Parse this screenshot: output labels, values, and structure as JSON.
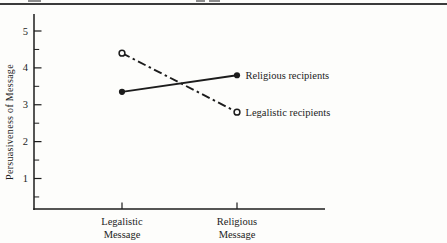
{
  "figure": {
    "background": "#fdfdfb",
    "ink": "#1c1c1c",
    "top_rule_color": "#3b3b3b"
  },
  "chart_data": {
    "type": "line",
    "title": "",
    "xlabel": "",
    "ylabel": "Persuasiveness of Message",
    "categories": [
      "Legalistic Message",
      "Religious Message"
    ],
    "category_lines": [
      [
        "Legalistic",
        "Message"
      ],
      [
        "Religious",
        "Message"
      ]
    ],
    "yticks": [
      5,
      4,
      3,
      2,
      1
    ],
    "ylim": [
      0,
      5.3
    ],
    "grid": false,
    "legend_position": "right-of-line-ends",
    "series": [
      {
        "name": "Religious recipients",
        "line": "solid",
        "marker": "filled-circle",
        "values": [
          3.35,
          3.8
        ]
      },
      {
        "name": "Legalistic recipients",
        "line": "dashed",
        "marker": "open-circle",
        "values": [
          4.4,
          2.8
        ]
      }
    ]
  }
}
